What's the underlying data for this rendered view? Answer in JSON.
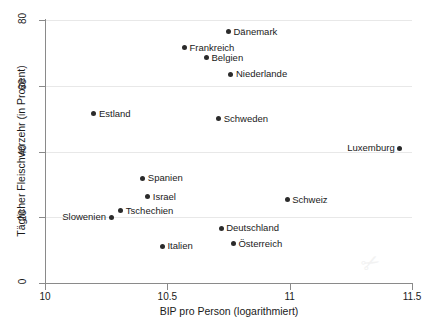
{
  "chart_data": {
    "type": "scatter",
    "title": "",
    "xlabel": "BIP pro Person (logarithmiert)",
    "ylabel": "Täglicher Fleischverzehr (in Prozent)",
    "xlim": [
      10,
      11.5
    ],
    "ylim": [
      0,
      80
    ],
    "xticks": [
      "10",
      "10.5",
      "11",
      "11.5"
    ],
    "xtick_values": [
      10,
      10.5,
      11,
      11.5
    ],
    "yticks": [
      "0",
      "20",
      "40",
      "60",
      "80"
    ],
    "ytick_values": [
      0,
      20,
      40,
      60,
      80
    ],
    "grid": "horizontal",
    "legend": "none",
    "marker_color": "#2b2b2b",
    "grid_color": "#e8e8e8",
    "axis_color": "#8a8a8a",
    "points": [
      {
        "label": "Dänemark",
        "x": 10.75,
        "y": 76.5,
        "label_side": "right"
      },
      {
        "label": "Frankreich",
        "x": 10.57,
        "y": 71.5,
        "label_side": "right"
      },
      {
        "label": "Belgien",
        "x": 10.66,
        "y": 68.5,
        "label_side": "right"
      },
      {
        "label": "Niederlande",
        "x": 10.76,
        "y": 63.5,
        "label_side": "right"
      },
      {
        "label": "Estland",
        "x": 10.2,
        "y": 51.5,
        "label_side": "right"
      },
      {
        "label": "Schweden",
        "x": 10.71,
        "y": 50.0,
        "label_side": "right"
      },
      {
        "label": "Luxemburg",
        "x": 11.45,
        "y": 41.0,
        "label_side": "left"
      },
      {
        "label": "Spanien",
        "x": 10.4,
        "y": 31.8,
        "label_side": "right"
      },
      {
        "label": "Israel",
        "x": 10.42,
        "y": 26.2,
        "label_side": "right"
      },
      {
        "label": "Schweiz",
        "x": 10.99,
        "y": 25.3,
        "label_side": "right"
      },
      {
        "label": "Tschechien",
        "x": 10.31,
        "y": 22.0,
        "label_side": "right"
      },
      {
        "label": "Slowenien",
        "x": 10.27,
        "y": 20.0,
        "label_side": "left"
      },
      {
        "label": "Deutschland",
        "x": 10.72,
        "y": 16.7,
        "label_side": "right"
      },
      {
        "label": "Österreich",
        "x": 10.77,
        "y": 11.9,
        "label_side": "right"
      },
      {
        "label": "Italien",
        "x": 10.48,
        "y": 11.2,
        "label_side": "right"
      }
    ]
  },
  "watermark": {
    "text": "✂"
  }
}
